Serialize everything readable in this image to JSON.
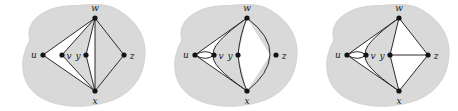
{
  "figure": {
    "title": "",
    "background_color": "#ffffff",
    "blob_fill": "#d9d9d9",
    "blob_stroke": "#d0d0d0",
    "region_fill": "#ffffff",
    "edge_color": "#2b2b2b",
    "vertex_color": "#141414",
    "panel_count": 3
  },
  "panels": [
    {
      "id": "panel-1",
      "name": "graph-embedding-1",
      "vertices": [
        {
          "id": "u",
          "label": "u",
          "cx": 43,
          "cy": 55,
          "label_dx": -9,
          "label_dy": 3
        },
        {
          "id": "v",
          "label": "v",
          "cx": 62,
          "cy": 55,
          "label_dx": 7,
          "label_dy": 4
        },
        {
          "id": "w",
          "label": "w",
          "cx": 95,
          "cy": 18,
          "label_dx": 0,
          "label_dy": -7
        },
        {
          "id": "x",
          "label": "x",
          "cx": 95,
          "cy": 91,
          "label_dx": 0,
          "label_dy": 13
        },
        {
          "id": "y",
          "label": "y",
          "cx": 86,
          "cy": 55,
          "label_dx": -8,
          "label_dy": 4
        },
        {
          "id": "z",
          "label": "z",
          "cx": 124,
          "cy": 55,
          "label_dx": 8,
          "label_dy": 4
        }
      ],
      "edges": [
        {
          "from": "u",
          "to": "w"
        },
        {
          "from": "u",
          "to": "x"
        },
        {
          "from": "v",
          "to": "w"
        },
        {
          "from": "v",
          "to": "x"
        },
        {
          "from": "y",
          "to": "w"
        },
        {
          "from": "y",
          "to": "x"
        },
        {
          "from": "w",
          "to": "x"
        },
        {
          "from": "w",
          "to": "z"
        },
        {
          "from": "x",
          "to": "z"
        }
      ],
      "white_faces": [
        "u-v-w-x wedge",
        "w-y-x left",
        "w-y-x right"
      ]
    },
    {
      "id": "panel-2",
      "name": "graph-embedding-2",
      "vertices": [
        {
          "id": "u",
          "label": "u",
          "cx": 43,
          "cy": 55,
          "label_dx": -9,
          "label_dy": 3
        },
        {
          "id": "v",
          "label": "v",
          "cx": 62,
          "cy": 55,
          "label_dx": 7,
          "label_dy": 4
        },
        {
          "id": "w",
          "label": "w",
          "cx": 95,
          "cy": 18,
          "label_dx": 0,
          "label_dy": -7
        },
        {
          "id": "x",
          "label": "x",
          "cx": 95,
          "cy": 91,
          "label_dx": 0,
          "label_dy": 13
        },
        {
          "id": "y",
          "label": "y",
          "cx": 86,
          "cy": 55,
          "label_dx": -8,
          "label_dy": 4
        },
        {
          "id": "z",
          "label": "z",
          "cx": 124,
          "cy": 55,
          "label_dx": 8,
          "label_dy": 4
        }
      ],
      "edges": [
        {
          "from": "u",
          "to": "w"
        },
        {
          "from": "u",
          "to": "x"
        },
        {
          "from": "u",
          "to": "v",
          "note": "upper lens arc"
        },
        {
          "from": "u",
          "to": "v",
          "note": "lower lens arc"
        },
        {
          "from": "v",
          "to": "w"
        },
        {
          "from": "v",
          "to": "x"
        },
        {
          "from": "y",
          "to": "w"
        },
        {
          "from": "y",
          "to": "x"
        }
      ],
      "white_faces": [
        "u-v lens",
        "u-v-w-x wedge",
        "w-y-x quad"
      ]
    },
    {
      "id": "panel-3",
      "name": "graph-embedding-3",
      "vertices": [
        {
          "id": "u",
          "label": "u",
          "cx": 43,
          "cy": 55,
          "label_dx": -9,
          "label_dy": 3
        },
        {
          "id": "v",
          "label": "v",
          "cx": 62,
          "cy": 55,
          "label_dx": 7,
          "label_dy": 4
        },
        {
          "id": "w",
          "label": "w",
          "cx": 95,
          "cy": 18,
          "label_dx": 0,
          "label_dy": -7
        },
        {
          "id": "x",
          "label": "x",
          "cx": 95,
          "cy": 91,
          "label_dx": 0,
          "label_dy": 13
        },
        {
          "id": "y",
          "label": "y",
          "cx": 86,
          "cy": 55,
          "label_dx": -8,
          "label_dy": 4
        },
        {
          "id": "z",
          "label": "z",
          "cx": 124,
          "cy": 55,
          "label_dx": 8,
          "label_dy": 4
        }
      ],
      "edges": [
        {
          "from": "u",
          "to": "w"
        },
        {
          "from": "u",
          "to": "x"
        },
        {
          "from": "u",
          "to": "v",
          "note": "upper lens arc"
        },
        {
          "from": "u",
          "to": "v",
          "note": "lower lens arc"
        },
        {
          "from": "v",
          "to": "w"
        },
        {
          "from": "v",
          "to": "x"
        },
        {
          "from": "y",
          "to": "w"
        },
        {
          "from": "y",
          "to": "x"
        },
        {
          "from": "y",
          "to": "z"
        },
        {
          "from": "w",
          "to": "z"
        },
        {
          "from": "x",
          "to": "z"
        }
      ],
      "white_faces": [
        "u-v lens",
        "u-v-w-x wedge",
        "w-y-z",
        "x-y-z"
      ]
    }
  ]
}
